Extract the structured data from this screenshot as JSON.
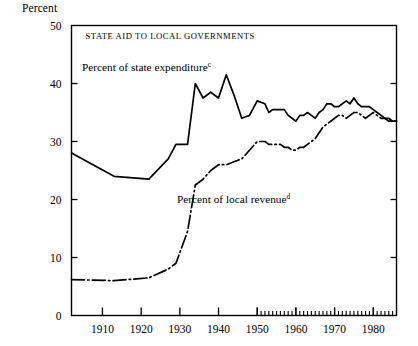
{
  "figure": {
    "axis_unit_label": "Percent",
    "title": "STATE AID TO LOCAL GOVERNMENTS"
  },
  "chart_data": {
    "type": "line",
    "title": "STATE AID TO LOCAL GOVERNMENTS",
    "xlabel": "",
    "ylabel": "Percent",
    "xlim": [
      1902,
      1986
    ],
    "ylim": [
      0,
      50
    ],
    "yticks": [
      0,
      10,
      20,
      30,
      40,
      50
    ],
    "ytick_labels": [
      "0",
      "10",
      "20",
      "30",
      "40",
      "50"
    ],
    "xticks": [
      1910,
      1920,
      1930,
      1940,
      1950,
      1960,
      1970,
      1980
    ],
    "xtick_labels": [
      "1910",
      "1920",
      "1930",
      "1940",
      "1950",
      "1960",
      "1970",
      "1980"
    ],
    "minor_xticks_from": 1950,
    "minor_xticks_to": 1986,
    "minor_xtick_step": 1,
    "grid": false,
    "legend": "inline-annotations",
    "annotations": [
      {
        "name": "state-expenditure-label",
        "text": "Percent of state expenditure",
        "superscript": "c",
        "x_px": 82,
        "y_px": 71
      },
      {
        "name": "local-revenue-label",
        "text": "Percent of local revenue",
        "superscript": "d",
        "x_px": 177,
        "y_px": 203
      }
    ],
    "series": [
      {
        "name": "Percent of state expenditure",
        "superscript": "c",
        "line_style": "solid",
        "color": "#000000",
        "x": [
          1902,
          1913,
          1922,
          1927,
          1929,
          1932,
          1934,
          1936,
          1938,
          1940,
          1942,
          1944,
          1946,
          1948,
          1950,
          1952,
          1953,
          1954,
          1955,
          1956,
          1957,
          1958,
          1959,
          1960,
          1961,
          1962,
          1963,
          1964,
          1965,
          1966,
          1967,
          1968,
          1969,
          1970,
          1971,
          1972,
          1973,
          1974,
          1975,
          1976,
          1977,
          1978,
          1979,
          1980,
          1981,
          1982,
          1983,
          1984,
          1985,
          1986
        ],
        "values": [
          28.0,
          24.0,
          23.5,
          27.0,
          29.5,
          29.5,
          40.0,
          37.5,
          38.5,
          37.5,
          41.5,
          38.0,
          34.0,
          34.5,
          37.0,
          36.5,
          35.0,
          35.5,
          35.5,
          35.5,
          35.5,
          34.5,
          34.0,
          33.5,
          34.5,
          34.5,
          35.0,
          34.5,
          34.0,
          35.0,
          35.5,
          36.5,
          36.5,
          36.0,
          36.0,
          36.5,
          37.0,
          36.5,
          37.5,
          36.5,
          36.0,
          36.0,
          36.0,
          35.5,
          35.0,
          34.5,
          34.0,
          33.5,
          33.5,
          33.5
        ]
      },
      {
        "name": "Percent of local revenue",
        "superscript": "d",
        "line_style": "dash-dot",
        "color": "#000000",
        "x": [
          1902,
          1913,
          1922,
          1927,
          1929,
          1932,
          1934,
          1936,
          1938,
          1940,
          1942,
          1944,
          1946,
          1948,
          1950,
          1952,
          1953,
          1954,
          1955,
          1956,
          1957,
          1958,
          1959,
          1960,
          1961,
          1962,
          1963,
          1964,
          1965,
          1966,
          1967,
          1968,
          1969,
          1970,
          1971,
          1972,
          1973,
          1974,
          1975,
          1976,
          1977,
          1978,
          1979,
          1980,
          1981,
          1982,
          1983,
          1984,
          1985,
          1986
        ],
        "values": [
          6.2,
          6.0,
          6.5,
          8.0,
          9.0,
          14.5,
          22.5,
          23.5,
          25.0,
          26.0,
          26.0,
          26.5,
          27.0,
          28.5,
          30.0,
          30.0,
          29.5,
          29.5,
          29.5,
          29.5,
          29.0,
          29.0,
          28.5,
          28.5,
          29.0,
          29.0,
          29.5,
          30.0,
          30.5,
          31.5,
          32.5,
          33.0,
          33.5,
          34.0,
          34.5,
          34.5,
          34.0,
          34.5,
          35.0,
          35.0,
          34.5,
          34.0,
          34.5,
          35.0,
          34.5,
          34.0,
          34.0,
          34.0,
          33.5,
          33.5
        ]
      }
    ]
  }
}
